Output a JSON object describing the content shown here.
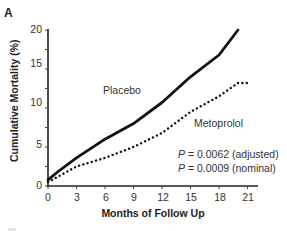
{
  "panel_label": "A",
  "chart_data": {
    "type": "line",
    "title": "",
    "xlabel": "Months of Follow Up",
    "ylabel": "Cumulative Mortality (%)",
    "xlim": [
      0,
      22
    ],
    "ylim": [
      0,
      20
    ],
    "xticks": [
      0,
      3,
      6,
      9,
      12,
      15,
      18,
      21
    ],
    "yticks": [
      0,
      5,
      10,
      15,
      20
    ],
    "grid": false,
    "series": [
      {
        "name": "Placebo",
        "style": "solid",
        "x": [
          0,
          1,
          3,
          6,
          9,
          12,
          15,
          18,
          20
        ],
        "values": [
          0.8,
          1.8,
          3.6,
          6.0,
          8.0,
          10.7,
          14.0,
          16.8,
          20.0
        ]
      },
      {
        "name": "Metoprolol",
        "style": "dotted",
        "x": [
          0,
          3,
          6,
          9,
          12,
          15,
          18,
          20,
          21
        ],
        "values": [
          0.5,
          2.5,
          3.6,
          5.0,
          6.8,
          9.5,
          11.5,
          13.2,
          13.2
        ]
      }
    ],
    "annotations": [
      {
        "italic": "P",
        "text": " = 0.0062 (adjusted)"
      },
      {
        "italic": "P",
        "text": " = 0.0009 (nominal)"
      }
    ]
  },
  "ytick_labels": [
    "20",
    "15",
    "10",
    "5",
    "0"
  ],
  "xtick_labels": [
    "0",
    "3",
    "6",
    "9",
    "12",
    "15",
    "18",
    "21"
  ],
  "series_labels": {
    "placebo": "Placebo",
    "metoprolol": "Metoprolol"
  },
  "pvalues": {
    "adjusted_p": "P",
    "adjusted_text": " = 0.0062 (adjusted)",
    "nominal_p": "P",
    "nominal_text": " = 0.0009 (nominal)"
  }
}
